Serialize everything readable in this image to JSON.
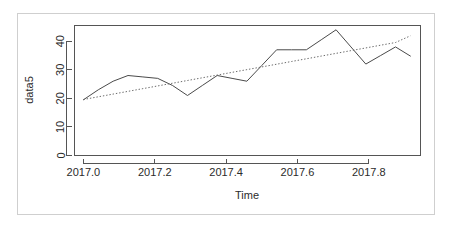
{
  "figure": {
    "kind": "r-base-plot",
    "background_color": "#ffffff",
    "frame_color": "#cfcfcf",
    "axis_color": "#555555",
    "series_color": "#4a4a4a",
    "trend_color": "#6b6b6b"
  },
  "chart_data": {
    "type": "line",
    "title": "",
    "subtitle": "",
    "xlabel": "Time",
    "ylabel": "data5",
    "xlim": [
      2016.975,
      2017.945
    ],
    "ylim": [
      0,
      45.5
    ],
    "grid": false,
    "legend": false,
    "legend_position": "none",
    "x_ticks": [
      2017.0,
      2017.2,
      2017.4,
      2017.6,
      2017.8
    ],
    "x_tick_labels": [
      "2017.0",
      "2017.2",
      "2017.4",
      "2017.6",
      "2017.8"
    ],
    "y_ticks": [
      0,
      10,
      20,
      30,
      40
    ],
    "y_tick_labels": [
      "0",
      "10",
      "20",
      "30",
      "40"
    ],
    "x": [
      2017.0,
      2017.0417,
      2017.0833,
      2017.125,
      2017.1667,
      2017.2083,
      2017.25,
      2017.2917,
      2017.3333,
      2017.375,
      2017.4167,
      2017.4583,
      2017.5,
      2017.5417,
      2017.5833,
      2017.625,
      2017.6667,
      2017.7083,
      2017.75,
      2017.7917,
      2017.8333,
      2017.875,
      2017.9167
    ],
    "series": [
      {
        "name": "data5",
        "style": "solid",
        "values": [
          19.5,
          23.0,
          26.0,
          28.0,
          27.5,
          27.0,
          24.5,
          21.0,
          24.5,
          28.0,
          27.0,
          26.0,
          31.5,
          37.0,
          37.0,
          37.0,
          40.5,
          44.0,
          38.0,
          32.0,
          35.0,
          38.0,
          34.8
        ]
      },
      {
        "name": "linear trend",
        "style": "dotted",
        "values": [
          19.6,
          20.55,
          21.5,
          22.45,
          23.4,
          24.35,
          25.3,
          26.25,
          27.2,
          28.15,
          29.1,
          30.05,
          31.0,
          31.95,
          32.9,
          33.85,
          34.8,
          35.75,
          36.7,
          37.65,
          38.6,
          39.55,
          41.9
        ]
      }
    ],
    "annotations": []
  }
}
